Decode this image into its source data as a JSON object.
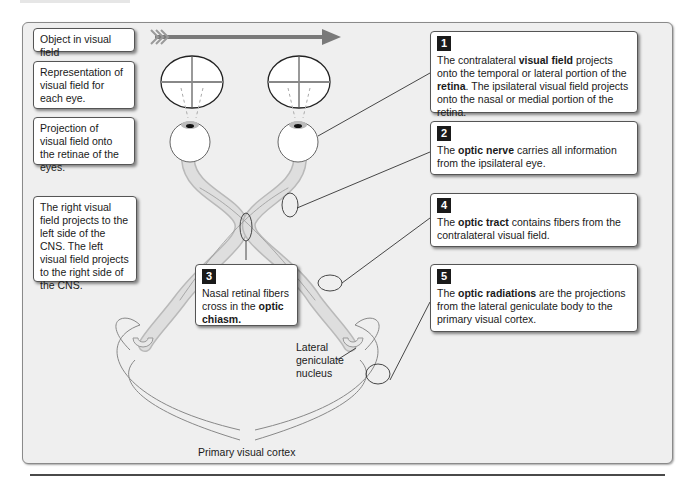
{
  "left_labels": {
    "object": "Object in visual field",
    "representation": "Representation of visual field for each eye.",
    "projection": "Projection of visual field onto the retinae of the eyes.",
    "crossing": "The right visual field projects to the left side of the CNS. The left visual field projects to the right side of the CNS."
  },
  "callouts": [
    {
      "number": "1",
      "pre": "The contralateral ",
      "bold1": "visual field",
      "mid": " projects onto the temporal or lateral portion of the ",
      "bold2": "retina",
      "post": ". The ipsilateral visual field projects onto the nasal or medial portion of the retina."
    },
    {
      "number": "2",
      "pre": "The ",
      "bold1": "optic nerve",
      "post": " carries all information from the ipsilateral eye."
    },
    {
      "number": "3",
      "pre": "Nasal retinal fibers cross in the ",
      "bold1": "optic chiasm."
    },
    {
      "number": "4",
      "pre": "The ",
      "bold1": "optic tract",
      "post": " contains fibers from the contralateral visual field."
    },
    {
      "number": "5",
      "pre": "The ",
      "bold1": "optic radiations",
      "post": " are the projections from the lateral geniculate body to the primary visual cortex."
    }
  ],
  "anatomy_labels": {
    "lgn": "Lateral geniculate nucleus",
    "cortex": "Primary visual cortex"
  },
  "colors": {
    "panel_bg": "#efefef",
    "arrow": "#7a7a7a",
    "number_badge": "#1a1a1a",
    "nerve_fill": "#dcdcdc"
  }
}
